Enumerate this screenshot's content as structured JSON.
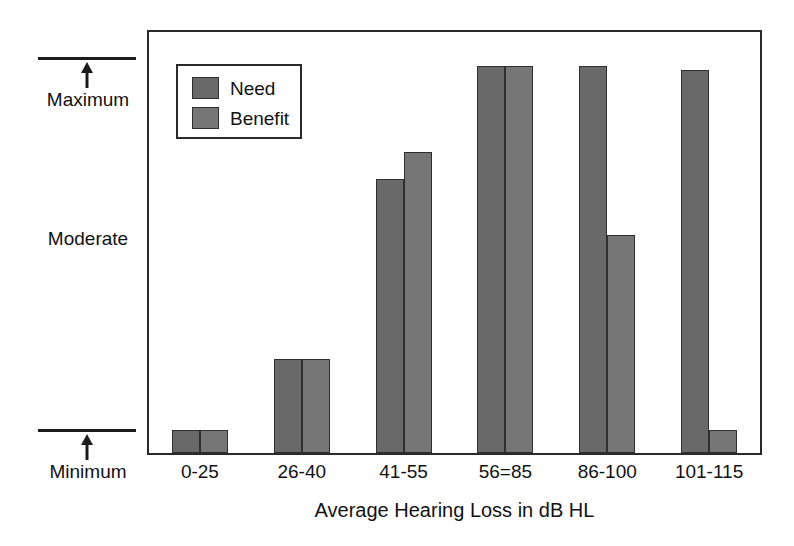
{
  "chart_data": {
    "type": "bar",
    "title": "",
    "xlabel": "Average Hearing Loss in dB HL",
    "ylabel": "",
    "categories": [
      "0-25",
      "26-40",
      "41-55",
      "56=85",
      "86-100",
      "101-115"
    ],
    "series": [
      {
        "name": "Need",
        "values": [
          0.06,
          0.25,
          0.73,
          1.03,
          1.03,
          1.02
        ]
      },
      {
        "name": "Benefit",
        "values": [
          0.06,
          0.25,
          0.8,
          1.03,
          0.58,
          0.06
        ]
      }
    ],
    "y_axis_annotations": [
      {
        "label": "Maximum",
        "position": "top"
      },
      {
        "label": "Moderate",
        "position": "middle"
      },
      {
        "label": "Minimum",
        "position": "bottom"
      }
    ],
    "ylim": [
      0,
      1.12
    ],
    "y_reference_lines": {
      "minimum": 0.0,
      "maximum": 1.12
    },
    "grid": false,
    "legend_position": "top-left",
    "colors": {
      "need": "#696969",
      "benefit": "#767676",
      "outline": "#2f2f2f",
      "frame": "#2a2a2a",
      "text": "#121212",
      "background": "#ffffff"
    }
  },
  "legend": {
    "items": [
      {
        "label": "Need"
      },
      {
        "label": "Benefit"
      }
    ]
  },
  "axis": {
    "x_title": "Average Hearing Loss in dB HL",
    "x_ticks": [
      "0-25",
      "26-40",
      "41-55",
      "56=85",
      "86-100",
      "101-115"
    ],
    "y_labels": {
      "maximum": "Maximum",
      "moderate": "Moderate",
      "minimum": "Minimum"
    }
  }
}
